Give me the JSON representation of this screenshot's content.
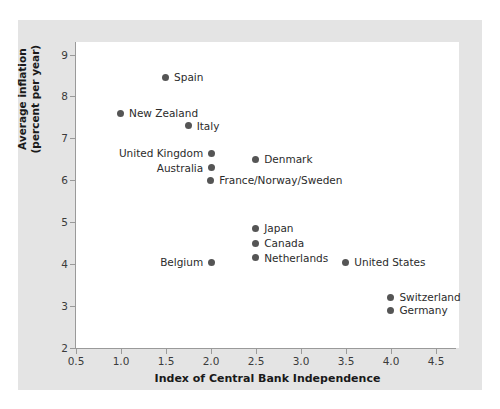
{
  "chart_data": {
    "type": "scatter",
    "title": "",
    "xlabel": "Index of Central Bank Independence",
    "ylabel": "Average inflation (percent per year)",
    "ylabel_line1": "Average inflation",
    "ylabel_line2": "(percent per year)",
    "xlim": [
      0.5,
      4.75
    ],
    "ylim": [
      2,
      9.3
    ],
    "xticks": [
      "0.5",
      "1.0",
      "1.5",
      "2.0",
      "2.5",
      "3.0",
      "3.5",
      "4.0",
      "4.5"
    ],
    "xtick_values": [
      0.5,
      1.0,
      1.5,
      2.0,
      2.5,
      3.0,
      3.5,
      4.0,
      4.5
    ],
    "yticks": [
      "2",
      "3",
      "4",
      "5",
      "6",
      "7",
      "8",
      "9"
    ],
    "ytick_values": [
      2,
      3,
      4,
      5,
      6,
      7,
      8,
      9
    ],
    "grid": false,
    "legend": false,
    "marker_color": "#555555",
    "points": [
      {
        "label": "Spain",
        "x": 1.5,
        "y": 8.45,
        "label_side": "right"
      },
      {
        "label": "New Zealand",
        "x": 1.0,
        "y": 7.6,
        "label_side": "right"
      },
      {
        "label": "Italy",
        "x": 1.75,
        "y": 7.3,
        "label_side": "right"
      },
      {
        "label": "United Kingdom",
        "x": 2.0,
        "y": 6.65,
        "label_side": "left"
      },
      {
        "label": "Australia",
        "x": 2.0,
        "y": 6.3,
        "label_side": "left"
      },
      {
        "label": "Denmark",
        "x": 2.5,
        "y": 6.5,
        "label_side": "right"
      },
      {
        "label": "France/Norway/Sweden",
        "x": 2.0,
        "y": 6.0,
        "label_side": "right"
      },
      {
        "label": "Japan",
        "x": 2.5,
        "y": 4.85,
        "label_side": "right"
      },
      {
        "label": "Canada",
        "x": 2.5,
        "y": 4.5,
        "label_side": "right"
      },
      {
        "label": "Netherlands",
        "x": 2.5,
        "y": 4.15,
        "label_side": "right"
      },
      {
        "label": "Belgium",
        "x": 2.0,
        "y": 4.05,
        "label_side": "left"
      },
      {
        "label": "United States",
        "x": 3.5,
        "y": 4.05,
        "label_side": "right"
      },
      {
        "label": "Switzerland",
        "x": 4.0,
        "y": 3.2,
        "label_side": "right"
      },
      {
        "label": "Germany",
        "x": 4.0,
        "y": 2.9,
        "label_side": "right"
      }
    ]
  }
}
